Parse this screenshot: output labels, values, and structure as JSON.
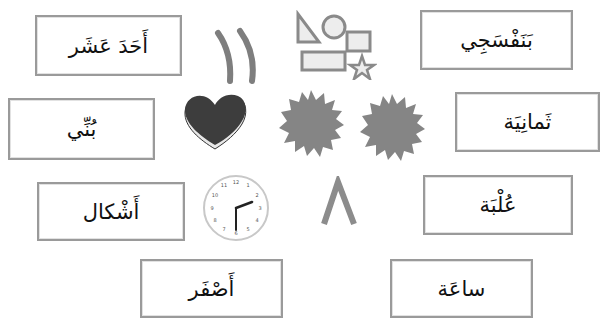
{
  "worksheet": {
    "word_cards": [
      {
        "id": "card-eleven",
        "label": "أَحَدَ عَشَر"
      },
      {
        "id": "card-violet",
        "label": "بَنَفْسَجِي"
      },
      {
        "id": "card-brown",
        "label": "بُنِّي"
      },
      {
        "id": "card-eight",
        "label": "ثَمانِيَة"
      },
      {
        "id": "card-shapes",
        "label": "أَشْكال"
      },
      {
        "id": "card-box",
        "label": "عُلْبَة"
      },
      {
        "id": "card-yellow",
        "label": "أَصْفَر"
      },
      {
        "id": "card-clock",
        "label": "ساعَة"
      }
    ],
    "pictures": [
      {
        "name": "arabic-numeral-eleven",
        "glyph": "١١"
      },
      {
        "name": "geometric-shapes"
      },
      {
        "name": "heart-box"
      },
      {
        "name": "starburst-left"
      },
      {
        "name": "starburst-right"
      },
      {
        "name": "clock",
        "time": "2:30"
      },
      {
        "name": "arabic-numeral-eight",
        "glyph": "٨"
      }
    ],
    "colors": {
      "border": "#9a9a9a",
      "shape_gray": "#8a8a8a",
      "heart_dark": "#3a3a3a",
      "text": "#111111"
    }
  }
}
